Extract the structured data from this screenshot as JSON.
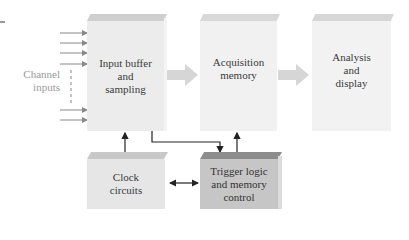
{
  "diagram": {
    "type": "block-diagram",
    "blocks": [
      {
        "id": "input",
        "label": "Input buffer\nand\nsampling"
      },
      {
        "id": "acq",
        "label": "Acquisition\nmemory"
      },
      {
        "id": "analysis",
        "label": "Analysis\nand\ndisplay"
      },
      {
        "id": "clock",
        "label": "Clock\ncircuits"
      },
      {
        "id": "trigger",
        "label": "Trigger logic\nand memory\ncontrol"
      }
    ],
    "side_label": "Channel\ninputs",
    "connections": [
      {
        "from": "channel-inputs",
        "to": "input"
      },
      {
        "from": "input",
        "to": "acq"
      },
      {
        "from": "acq",
        "to": "analysis"
      },
      {
        "from": "clock",
        "to": "input"
      },
      {
        "from": "input",
        "to": "trigger"
      },
      {
        "from": "trigger",
        "to": "acq"
      },
      {
        "from": "clock",
        "to": "trigger",
        "bidirectional": true
      }
    ],
    "colors": {
      "block_light": "#efefef",
      "block_top": "#cfcfcf",
      "block_dark": "#c4c4c4",
      "block_dark_top": "#8c8c8c",
      "arrow_fat": "#d6d6d6",
      "line": "#222222"
    }
  }
}
